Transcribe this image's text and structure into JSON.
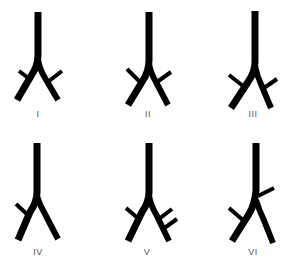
{
  "diagram": {
    "type": "bronchial-branching-variants",
    "panels": [
      {
        "label": "I",
        "description": "symmetric bifurcation with one side branch on each main bronchus"
      },
      {
        "label": "II",
        "description": "bifurcation with side branches arising higher on each main bronchus"
      },
      {
        "label": "III",
        "description": "bifurcation with left side branch high and right side branch low"
      },
      {
        "label": "IV",
        "description": "bifurcation with only a left side branch"
      },
      {
        "label": "V",
        "description": "bifurcation with one left side branch and two right side branches"
      },
      {
        "label": "VI",
        "description": "right side branch arising from the trachea above the bifurcation, left side branch on left bronchus"
      }
    ]
  },
  "colors": {
    "stroke": "#000000",
    "label": "#555555",
    "background": "#ffffff"
  }
}
